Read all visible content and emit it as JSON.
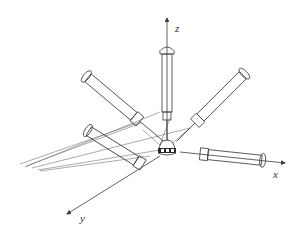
{
  "figure": {
    "axes": {
      "x": {
        "label": "x"
      },
      "y": {
        "label": "y"
      },
      "z": {
        "label": "z"
      }
    },
    "syringe_count": 5,
    "colors": {
      "stroke": "#3a3a3a",
      "background": "#ffffff"
    }
  }
}
